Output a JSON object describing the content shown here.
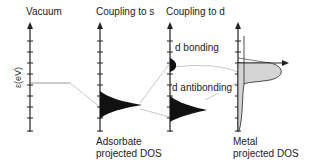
{
  "figure": {
    "panels": [
      {
        "id": "vacuum",
        "title": "Vacuum"
      },
      {
        "id": "coupling-s",
        "title": "Coupling to s"
      },
      {
        "id": "coupling-d",
        "title": "Coupling to d"
      },
      {
        "id": "metal",
        "title": ""
      }
    ],
    "y_axis_label": "ε(eV)",
    "state_labels": {
      "bonding": "d bonding",
      "antibonding": "d antibonding"
    },
    "bottom_labels": {
      "adsorbate_line1": "Adsorbate",
      "adsorbate_line2": "projected DOS",
      "metal_line1": "Metal",
      "metal_line2": "projected DOS"
    },
    "colors": {
      "axis": "#222222",
      "adsorbate_fill": "#111111",
      "metal_fill": "#d4d4d4",
      "connector": "#c8c8c8"
    }
  }
}
